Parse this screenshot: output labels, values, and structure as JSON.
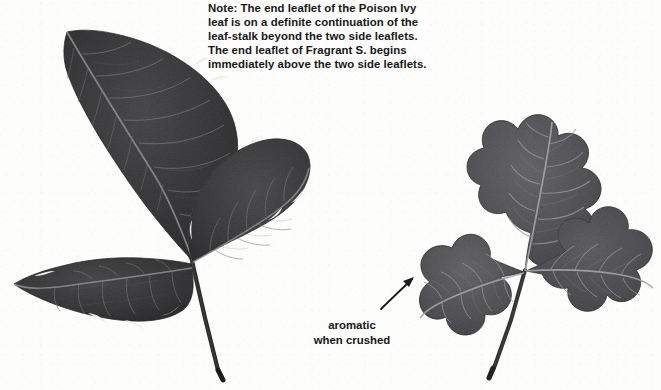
{
  "page": {
    "background_color": "#fdfdfc",
    "ink_color": "#17171a",
    "width": 661,
    "height": 390
  },
  "note": {
    "lines": [
      "Note: The end leaflet of the Poison Ivy",
      "leaf is on a definite continuation of the",
      "leaf-stalk beyond the two side leaflets.",
      "The end leaflet of Fragrant S. begins",
      "immediately above the two side leaflets."
    ],
    "full_text": "Note: The end leaflet of the Poison Ivy leaf is on a definite continuation of the leaf-stalk beyond the two side leaflets. The end leaflet of Fragrant S. begins immediately above the two side leaflets."
  },
  "caption": {
    "line1": "aromatic",
    "line2": "when crushed"
  },
  "arrow": {
    "name": "pointer-arrow",
    "direction": "up-right",
    "from_x": 9,
    "from_y": 41,
    "to_x": 42,
    "to_y": 9
  },
  "specimens": [
    {
      "id": "poison-ivy",
      "label": "Poison Ivy",
      "position": "left",
      "leaflet_count": 3,
      "leaf_fill": "#3b3b3c",
      "leaf_fill_light": "#565658",
      "vein_color": "#8b8b8d",
      "stem_color": "#2a2a2b",
      "description": "Trifoliate leaf with pointed, slightly toothed leaflets; end leaflet on a long stalk beyond the two side leaflets."
    },
    {
      "id": "fragrant-sumac",
      "label": "Fragrant S.",
      "position": "right",
      "leaflet_count": 3,
      "leaf_fill": "#575759",
      "leaf_fill_light": "#6d6d6f",
      "vein_color": "#a6a6a8",
      "stem_color": "#303031",
      "description": "Trifoliate leaf with lobed, oak-like scalloped leaflets; end leaflet begins immediately above the two side leaflets; aromatic when crushed."
    }
  ]
}
